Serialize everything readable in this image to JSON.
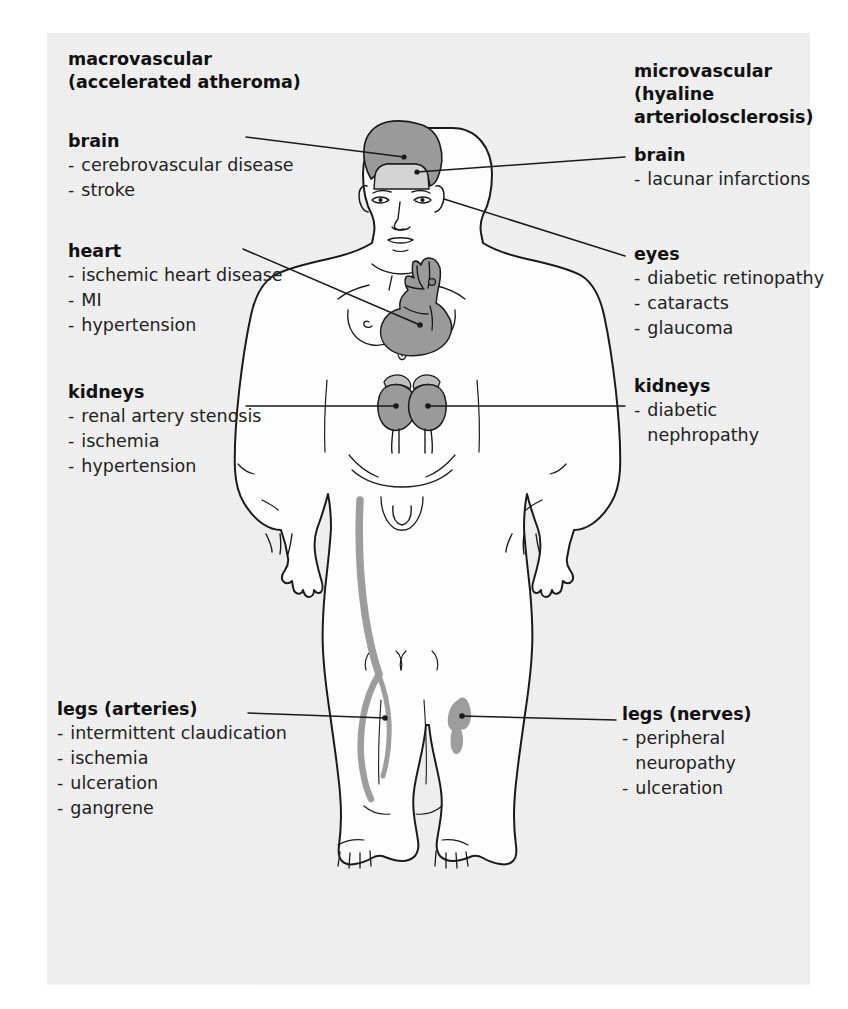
{
  "figure": {
    "background_color": "#ececec",
    "page_color": "#ffffff",
    "line_color": "#1a1a1a",
    "organ_fill": "#9a9a9a",
    "vessel_fill": "#9d9d9d",
    "body_fill": "#fdfdfd"
  },
  "columns": {
    "left": {
      "title": "macrovascular\n(accelerated atheroma)",
      "sections": [
        {
          "heading": "brain",
          "items": [
            "cerebrovascular disease",
            "stroke"
          ]
        },
        {
          "heading": "heart",
          "items": [
            "ischemic heart disease",
            "MI",
            "hypertension"
          ]
        },
        {
          "heading": "kidneys",
          "items": [
            "renal artery stenosis",
            "ischemia",
            "hypertension"
          ]
        },
        {
          "heading": "legs (arteries)",
          "items": [
            "intermittent claudication",
            "ischemia",
            "ulceration",
            "gangrene"
          ]
        }
      ]
    },
    "right": {
      "title": "microvascular\n(hyaline\narteriolosclerosis)",
      "sections": [
        {
          "heading": "brain",
          "items": [
            "lacunar infarctions"
          ]
        },
        {
          "heading": "eyes",
          "items": [
            "diabetic retinopathy",
            "cataracts",
            "glaucoma"
          ]
        },
        {
          "heading": "kidneys",
          "items": [
            "diabetic\nnephropathy"
          ]
        },
        {
          "heading": "legs (nerves)",
          "items": [
            "peripheral\nneuropathy",
            "ulceration"
          ]
        }
      ]
    }
  },
  "bullet": "-",
  "anatomy": {
    "figure_label": "anterior male human body outline",
    "highlighted_organs": [
      "brain",
      "heart",
      "kidneys",
      "leg artery",
      "leg nerve"
    ]
  }
}
